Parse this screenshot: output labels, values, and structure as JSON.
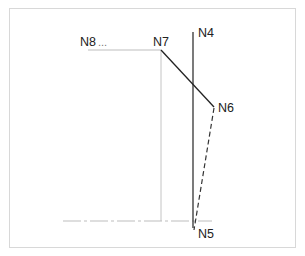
{
  "diagram": {
    "nodes": {
      "n8": {
        "label": "N8",
        "suffix": "..."
      },
      "n7": {
        "label": "N7"
      },
      "n4": {
        "label": "N4"
      },
      "n6": {
        "label": "N6"
      },
      "n5": {
        "label": "N5"
      }
    },
    "edges": [
      {
        "from": "N8",
        "to": "N7",
        "style": "thin-gray"
      },
      {
        "from": "N7",
        "to": "N6",
        "style": "solid-dark"
      },
      {
        "from": "N4",
        "to": "N5",
        "style": "solid-dark"
      },
      {
        "from": "N6",
        "to": "N5",
        "style": "dashed-dark"
      },
      {
        "from": "N7",
        "to": "baseline",
        "style": "thin-gray"
      },
      {
        "from": "baseline",
        "to": "baseline",
        "style": "dash-dot-gray"
      }
    ],
    "colors": {
      "dark_line": "#222222",
      "light_line": "#bdbdbd",
      "frame": "#d8d8d8"
    }
  }
}
